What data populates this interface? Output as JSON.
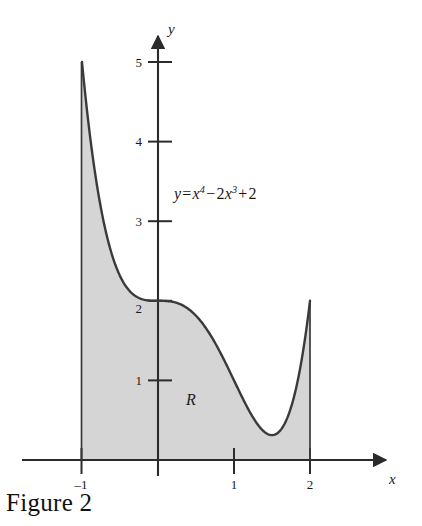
{
  "caption": "Figure 2",
  "chart_data": {
    "type": "line",
    "title": "",
    "xlabel": "x",
    "ylabel": "y",
    "equation_text": "y = x⁴ − 2x³ + 2",
    "equation_parts": {
      "lhs": "y",
      "equals": "=",
      "term1_base": "x",
      "term1_exp": "4",
      "minus": "−",
      "term2_coef": "2",
      "term2_base": "x",
      "term2_exp": "3",
      "plus": "+",
      "constant": "2"
    },
    "region_label": "R",
    "xlim": [
      -1.45,
      2.65
    ],
    "ylim": [
      -0.35,
      5.55
    ],
    "xticks": [
      -1,
      1,
      2
    ],
    "xtick_labels": [
      "–1",
      "1",
      "2"
    ],
    "yticks": [
      1,
      2,
      3,
      4,
      5
    ],
    "ytick_labels": [
      "1",
      "2",
      "3",
      "4",
      "5"
    ],
    "grid": false,
    "legend": "none",
    "shaded_region": {
      "label": "R",
      "x_from": -1,
      "x_to": 2,
      "fill_color": "#d5d5d5"
    },
    "curve_color": "#3a3a3a",
    "axis_color": "#2b2b2b",
    "x": [
      -1,
      -0.9,
      -0.8,
      -0.7,
      -0.6,
      -0.5,
      -0.4,
      -0.3,
      -0.2,
      -0.1,
      0,
      0.1,
      0.2,
      0.3,
      0.4,
      0.5,
      0.6,
      0.7,
      0.8,
      0.9,
      1,
      1.1,
      1.2,
      1.3,
      1.4,
      1.5,
      1.6,
      1.7,
      1.8,
      1.9,
      2
    ],
    "y": [
      5,
      4.114,
      3.434,
      2.926,
      2.562,
      2.313,
      2.154,
      2.062,
      2.018,
      2.002,
      2,
      1.998,
      1.985,
      1.954,
      1.898,
      1.813,
      1.69,
      1.526,
      1.318,
      1.064,
      1,
      0.668,
      0.27,
      -0.19,
      -0.705,
      -0.3125,
      0.159,
      1.253,
      1.132,
      1.324,
      2
    ],
    "y_actual_note": "y = x^4 - 2x^3 + 2 on [-1, 2]",
    "key_points": [
      {
        "x": -1,
        "y": 5
      },
      {
        "x": 0,
        "y": 2
      },
      {
        "x": 1,
        "y": 1
      },
      {
        "x": 1.5,
        "y": 0.3125
      },
      {
        "x": 2,
        "y": 2
      }
    ]
  }
}
